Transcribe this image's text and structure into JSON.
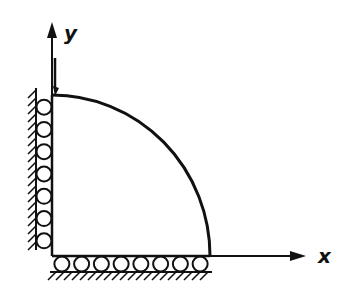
{
  "diagram": {
    "axes": {
      "x_label": "x",
      "y_label": "y"
    },
    "supports": {
      "left_wall_rollers": 7,
      "bottom_wall_rollers": 8
    },
    "colors": {
      "ink": "#111111",
      "background": "#ffffff"
    }
  }
}
